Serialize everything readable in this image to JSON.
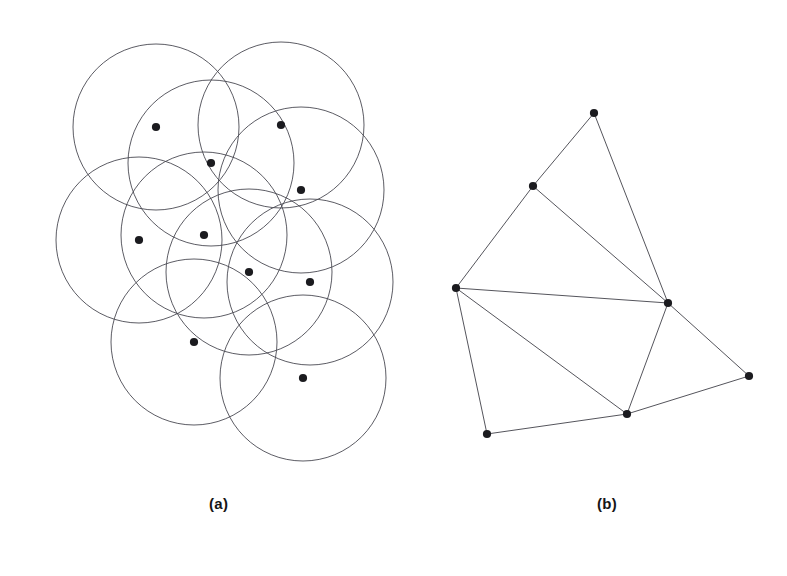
{
  "figure": {
    "background": "#ffffff",
    "width": 787,
    "height": 576,
    "disk_stroke": "#4a4a52",
    "edge_stroke": "#55555c",
    "node_fill": "#1b1b1f",
    "node_radius": 4.1,
    "disk_radius": 83
  },
  "captions": {
    "a": "(a)",
    "b": "(b)"
  },
  "chart_data": {
    "type": "scatter",
    "title": "",
    "xlabel": "",
    "ylabel": "",
    "panels": [
      {
        "id": "a",
        "label": "(a)",
        "description": "unit disk arrangement",
        "disk_radius": 83,
        "points": [
          {
            "id": "p1",
            "x": 156,
            "y": 127
          },
          {
            "id": "p2",
            "x": 211,
            "y": 163
          },
          {
            "id": "p3",
            "x": 281,
            "y": 125
          },
          {
            "id": "p4",
            "x": 301,
            "y": 190
          },
          {
            "id": "p5",
            "x": 139,
            "y": 240
          },
          {
            "id": "p6",
            "x": 204,
            "y": 235
          },
          {
            "id": "p7",
            "x": 249,
            "y": 272
          },
          {
            "id": "p8",
            "x": 310,
            "y": 282
          },
          {
            "id": "p9",
            "x": 194,
            "y": 342
          },
          {
            "id": "p10",
            "x": 303,
            "y": 378
          }
        ]
      },
      {
        "id": "b",
        "label": "(b)",
        "description": "intersection graph of the disks",
        "vertices": [
          {
            "id": "v1",
            "x": 594,
            "y": 113
          },
          {
            "id": "v2",
            "x": 533,
            "y": 186
          },
          {
            "id": "v3",
            "x": 456,
            "y": 288
          },
          {
            "id": "v4",
            "x": 668,
            "y": 303
          },
          {
            "id": "v5",
            "x": 749,
            "y": 376
          },
          {
            "id": "v6",
            "x": 627,
            "y": 414
          },
          {
            "id": "v7",
            "x": 487,
            "y": 434
          }
        ],
        "edges": [
          {
            "from": "v1",
            "to": "v2"
          },
          {
            "from": "v1",
            "to": "v4"
          },
          {
            "from": "v2",
            "to": "v3"
          },
          {
            "from": "v2",
            "to": "v4"
          },
          {
            "from": "v3",
            "to": "v4"
          },
          {
            "from": "v3",
            "to": "v6"
          },
          {
            "from": "v3",
            "to": "v7"
          },
          {
            "from": "v4",
            "to": "v5"
          },
          {
            "from": "v4",
            "to": "v6"
          },
          {
            "from": "v5",
            "to": "v6"
          },
          {
            "from": "v6",
            "to": "v7"
          }
        ]
      }
    ]
  }
}
